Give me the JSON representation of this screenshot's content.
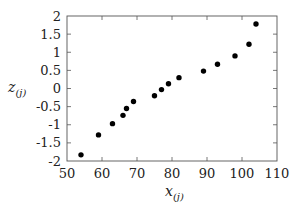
{
  "chart_data": {
    "type": "scatter",
    "title": "",
    "xlabel": "x_(j)",
    "ylabel": "z_(j)",
    "xlabel_main": "x",
    "xlabel_sub": "(j)",
    "ylabel_main": "z",
    "ylabel_sub": "(j)",
    "xlim": [
      50,
      110
    ],
    "ylim": [
      -2,
      2
    ],
    "x_ticks": [
      50,
      60,
      70,
      80,
      90,
      100,
      110
    ],
    "y_ticks": [
      -2,
      -1.5,
      -1,
      -0.5,
      0,
      0.5,
      1,
      1.5,
      2
    ],
    "x_tick_labels": [
      "50",
      "60",
      "70",
      "80",
      "90",
      "100",
      "110"
    ],
    "y_tick_labels": [
      "-2",
      "-1.5",
      "-1",
      "-0.5",
      "0",
      "0.5",
      "1",
      "1.5",
      "2"
    ],
    "grid": false,
    "legend": null,
    "marker_color": "#000000",
    "series": [
      {
        "name": "points",
        "x": [
          54,
          59,
          63,
          66,
          67,
          69,
          75,
          77,
          79,
          82,
          89,
          93,
          98,
          102,
          104
        ],
        "y": [
          -1.83,
          -1.28,
          -0.97,
          -0.74,
          -0.55,
          -0.36,
          -0.2,
          -0.03,
          0.13,
          0.3,
          0.48,
          0.67,
          0.9,
          1.22,
          1.78
        ]
      }
    ]
  }
}
